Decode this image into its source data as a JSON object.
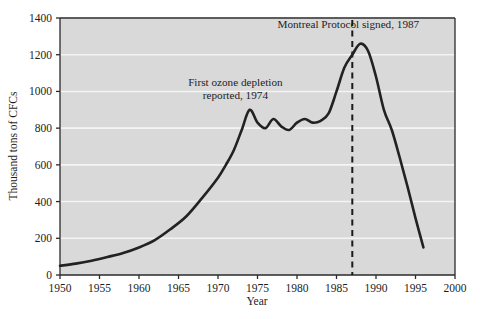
{
  "chart_data": {
    "type": "line",
    "title": "",
    "xlabel": "Year",
    "ylabel": "Thousand tons of CFCs",
    "xlim": [
      1950,
      2000
    ],
    "ylim": [
      0,
      1400
    ],
    "xticks": [
      1950,
      1955,
      1960,
      1965,
      1970,
      1975,
      1980,
      1985,
      1990,
      1995,
      2000
    ],
    "xtick_labels": [
      "1950",
      "1955",
      "1960",
      "1965",
      "1970",
      "1975",
      "1980",
      "1985",
      "1990",
      "1995",
      "2000"
    ],
    "yticks": [
      0,
      200,
      400,
      600,
      800,
      1000,
      1200,
      1400
    ],
    "ytick_labels": [
      "0",
      "200",
      "400",
      "600",
      "800",
      "1000",
      "1200",
      "1400"
    ],
    "grid": "horizontal-white-gridlines",
    "plot_background": "#d9d9d9",
    "line_color": "#222222",
    "legend": "none",
    "series": [
      {
        "name": "Global CFC production",
        "x": [
          1950,
          1952,
          1954,
          1956,
          1958,
          1960,
          1962,
          1964,
          1966,
          1968,
          1970,
          1971,
          1972,
          1973,
          1974,
          1975,
          1976,
          1977,
          1978,
          1979,
          1980,
          1981,
          1982,
          1983,
          1984,
          1985,
          1986,
          1987,
          1988,
          1989,
          1990,
          1991,
          1992,
          1993,
          1994,
          1995,
          1996
        ],
        "y": [
          50,
          62,
          78,
          98,
          120,
          150,
          190,
          250,
          320,
          420,
          530,
          600,
          680,
          790,
          900,
          830,
          800,
          850,
          810,
          790,
          830,
          850,
          830,
          840,
          880,
          1000,
          1130,
          1200,
          1260,
          1220,
          1080,
          900,
          790,
          640,
          480,
          310,
          150
        ]
      }
    ],
    "annotations": [
      {
        "name": "first-ozone-depletion",
        "lines": [
          "First ozone depletion",
          "reported, 1974"
        ],
        "x": 1972.2,
        "y": 1030
      },
      {
        "name": "montreal-protocol",
        "lines": [
          "Montreal Protocol signed, 1987"
        ],
        "x": 1986.5,
        "y": 1345
      }
    ],
    "reference_lines": [
      {
        "name": "montreal-protocol-1987",
        "orientation": "vertical",
        "x": 1987,
        "style": "dashed",
        "color": "#1a1a1a"
      }
    ]
  }
}
